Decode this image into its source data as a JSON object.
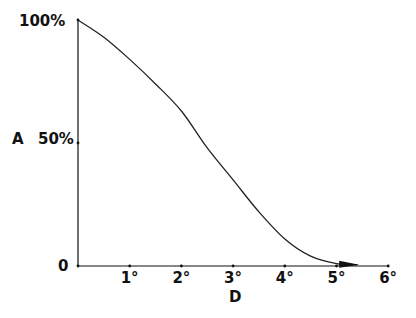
{
  "chart_data": {
    "type": "line",
    "title": "",
    "xlabel": "D",
    "ylabel": "A",
    "x_tick_labels": [
      "1°",
      "2°",
      "3°",
      "4°",
      "5°",
      "6°"
    ],
    "y_tick_labels": [
      "0",
      "50%",
      "100%"
    ],
    "xlim": [
      0,
      6
    ],
    "ylim": [
      0,
      100
    ],
    "grid": false,
    "legend": null,
    "series": [
      {
        "name": "A vs D",
        "x": [
          0,
          0.5,
          1,
          1.5,
          2,
          2.5,
          3,
          3.5,
          4,
          4.5,
          5,
          5.4
        ],
        "y": [
          100,
          93,
          84,
          74,
          63,
          48,
          35,
          22,
          11,
          4,
          1,
          0.5
        ]
      }
    ],
    "annotations": [
      "arrowhead at end of curve near D=5.4°"
    ]
  },
  "labels": {
    "y_top": "100%",
    "y_mid": "50%",
    "y_zero": "0",
    "y_axis_title": "A",
    "x_axis_title": "D",
    "x_ticks": [
      "1°",
      "2°",
      "3°",
      "4°",
      "5°",
      "6°"
    ]
  },
  "colors": {
    "ink": "#111111",
    "background": "#ffffff"
  }
}
